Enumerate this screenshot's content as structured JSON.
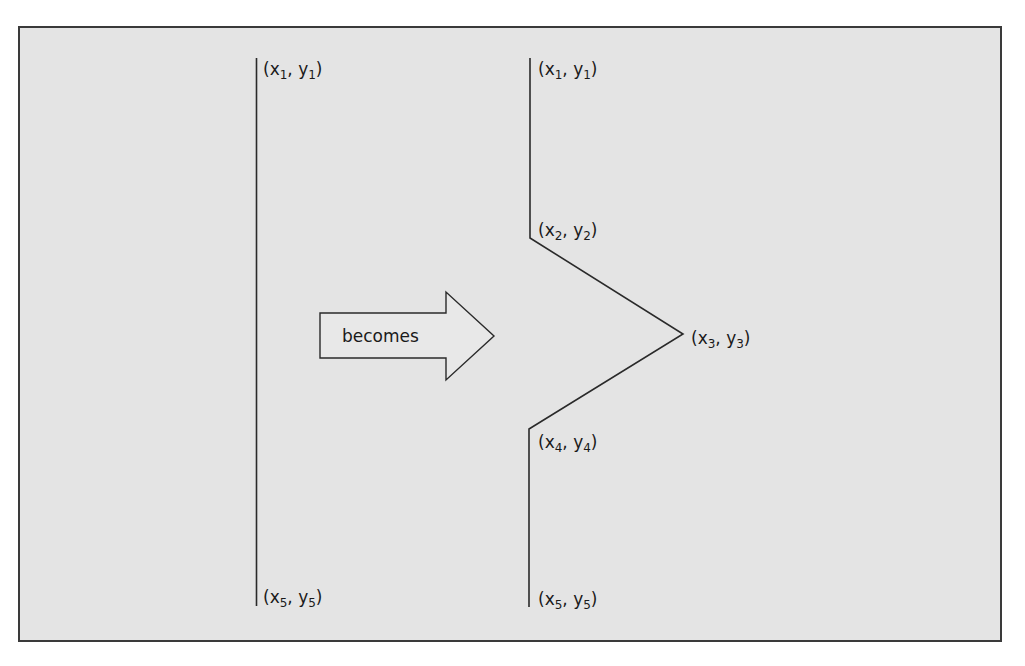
{
  "diagram": {
    "background_color": "#e4e4e4",
    "border_color": "#3a3a3a",
    "line_color": "#2a2a2a",
    "arrow": {
      "label": "becomes",
      "fill": "#e8e8e8"
    },
    "left_line": {
      "description": "straight vertical line segment",
      "points": [
        {
          "var": "x",
          "sub": "1",
          "var2": "y",
          "sub2": "1"
        },
        {
          "var": "x",
          "sub": "5",
          "var2": "y",
          "sub2": "5"
        }
      ]
    },
    "right_shape": {
      "description": "vertical line with a triangular bump pointing right",
      "points": [
        {
          "var": "x",
          "sub": "1",
          "var2": "y",
          "sub2": "1"
        },
        {
          "var": "x",
          "sub": "2",
          "var2": "y",
          "sub2": "2"
        },
        {
          "var": "x",
          "sub": "3",
          "var2": "y",
          "sub2": "3"
        },
        {
          "var": "x",
          "sub": "4",
          "var2": "y",
          "sub2": "4"
        },
        {
          "var": "x",
          "sub": "5",
          "var2": "y",
          "sub2": "5"
        }
      ]
    }
  }
}
